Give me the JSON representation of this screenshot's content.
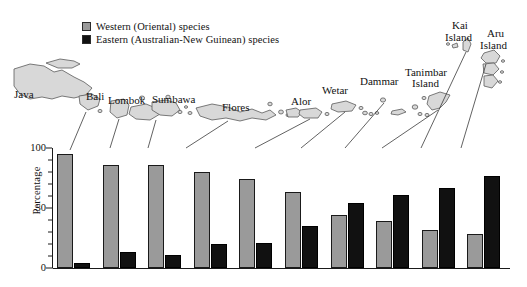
{
  "legend": {
    "items": [
      {
        "label": "Western (Oriental) species",
        "color": "#9a9a9a",
        "key": "west"
      },
      {
        "label": "Eastern (Australian-New Guinean) species",
        "color": "#111111",
        "key": "east"
      }
    ]
  },
  "axis": {
    "ylabel": "Percentage",
    "yticks": [
      "0",
      "50",
      "100"
    ]
  },
  "map_labels": [
    {
      "text": "Java",
      "x": 14,
      "y": 88
    },
    {
      "text": "Bali",
      "x": 86,
      "y": 90
    },
    {
      "text": "Lombok",
      "x": 108,
      "y": 94
    },
    {
      "text": "Sumbawa",
      "x": 152,
      "y": 93
    },
    {
      "text": "Flores",
      "x": 222,
      "y": 101
    },
    {
      "text": "Alor",
      "x": 291,
      "y": 95
    },
    {
      "text": "Wetar",
      "x": 322,
      "y": 84
    },
    {
      "text": "Dammar",
      "x": 360,
      "y": 75
    },
    {
      "text": "Tanimbar",
      "x": 405,
      "y": 66
    },
    {
      "text": "Island",
      "x": 412,
      "y": 77
    },
    {
      "text": "Kai",
      "x": 452,
      "y": 19
    },
    {
      "text": "Island",
      "x": 445,
      "y": 31
    },
    {
      "text": "Aru",
      "x": 487,
      "y": 27
    },
    {
      "text": "Island",
      "x": 480,
      "y": 39
    }
  ],
  "chart_data": {
    "type": "bar",
    "title": "",
    "xlabel": "",
    "ylabel": "Percentage",
    "ylim": [
      0,
      100
    ],
    "yticks": [
      0,
      50,
      100
    ],
    "grid": false,
    "legend_position": "top-left",
    "categories": [
      "Bali",
      "Lombok",
      "Sumbawa",
      "Flores",
      "Alor",
      "Wetar",
      "Dammar",
      "Tanimbar Island",
      "Kai Island",
      "Aru Island"
    ],
    "series": [
      {
        "name": "Western (Oriental) species",
        "color": "#9a9a9a",
        "values": [
          95,
          86,
          86,
          80,
          74,
          63,
          44,
          39,
          32,
          28
        ]
      },
      {
        "name": "Eastern (Australian-New Guinean) species",
        "color": "#111111",
        "values": [
          4,
          13,
          11,
          20,
          21,
          35,
          54,
          61,
          67,
          77
        ]
      }
    ]
  }
}
